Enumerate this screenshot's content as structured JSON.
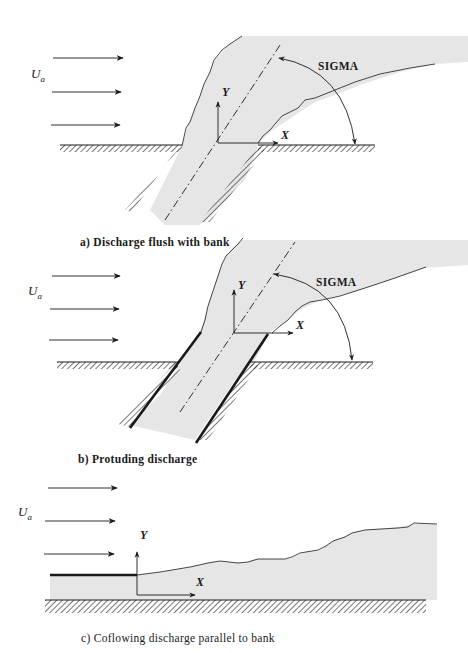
{
  "figure": {
    "panels": [
      {
        "id": "a",
        "caption": "a) Discharge flush with bank",
        "freestream_label": "U",
        "freestream_sub": "a",
        "y_axis_label": "Y",
        "x_axis_label": "X",
        "angle_label": "SIGMA"
      },
      {
        "id": "b",
        "caption": "b) Protuding discharge",
        "freestream_label": "U",
        "freestream_sub": "a",
        "y_axis_label": "Y",
        "x_axis_label": "X",
        "angle_label": "SIGMA"
      },
      {
        "id": "c",
        "caption": "c) Coflowing discharge parallel to bank",
        "freestream_label": "U",
        "freestream_sub": "a",
        "y_axis_label": "Y",
        "x_axis_label": "X"
      }
    ],
    "colors": {
      "ink": "#1a1a1a",
      "plume_fill": "#e6e6e6",
      "background": "#ffffff"
    }
  }
}
